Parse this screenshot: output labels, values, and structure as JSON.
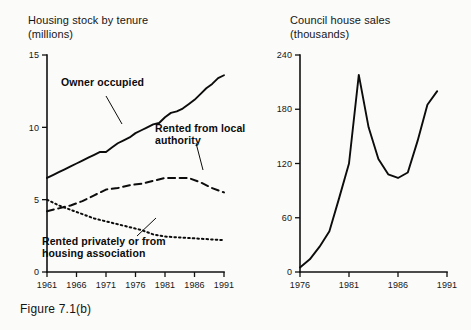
{
  "figure": {
    "caption": "Figure 7.1(b)"
  },
  "panels": {
    "left": {
      "title_line1": "Housing stock by tenure",
      "title_line2": "(millions)",
      "annotations": [
        {
          "name": "owner-occupied",
          "line1": "Owner occupied",
          "line2": ""
        },
        {
          "name": "rented-local-authority",
          "line1": "Rented from local",
          "line2": "authority"
        },
        {
          "name": "rented-privately",
          "line1": "Rented privately or from",
          "line2": "housing association"
        }
      ]
    },
    "right": {
      "title_line1": "Council house sales",
      "title_line2": "(thousands)"
    }
  },
  "chart_data": [
    {
      "id": "housing-stock-by-tenure",
      "type": "line",
      "title": "Housing stock by tenure (millions)",
      "xlabel": "",
      "ylabel": "millions",
      "xlim": [
        1961,
        1991
      ],
      "ylim": [
        0,
        15
      ],
      "yticks": [
        0,
        5,
        10,
        15
      ],
      "ytick_labels": [
        "0",
        "5",
        "10",
        "15"
      ],
      "xticks": [
        1961,
        1966,
        1971,
        1976,
        1981,
        1986,
        1991
      ],
      "xtick_labels": [
        "1961",
        "1966",
        "1971",
        "1976",
        "1981",
        "1986",
        "1991"
      ],
      "grid": false,
      "legend": "inline-annotations",
      "series": [
        {
          "name": "Owner occupied",
          "style": "solid",
          "x": [
            1961,
            1962,
            1963,
            1964,
            1965,
            1966,
            1967,
            1968,
            1969,
            1970,
            1971,
            1972,
            1973,
            1974,
            1975,
            1976,
            1977,
            1978,
            1979,
            1980,
            1981,
            1982,
            1983,
            1984,
            1985,
            1986,
            1987,
            1988,
            1989,
            1990,
            1991
          ],
          "values": [
            6.5,
            6.7,
            6.9,
            7.1,
            7.3,
            7.5,
            7.7,
            7.9,
            8.1,
            8.3,
            8.3,
            8.6,
            8.9,
            9.1,
            9.3,
            9.6,
            9.8,
            10.0,
            10.2,
            10.3,
            10.7,
            11.0,
            11.1,
            11.3,
            11.6,
            11.9,
            12.3,
            12.7,
            13.0,
            13.4,
            13.6,
            14.0,
            14.2,
            14.7,
            15.0
          ],
          "values_note": "traced from plotted curve, millions of dwellings"
        },
        {
          "name": "Rented from local authority",
          "style": "dashed",
          "x": [
            1961,
            1963,
            1965,
            1967,
            1969,
            1971,
            1973,
            1975,
            1977,
            1979,
            1981,
            1983,
            1985,
            1987,
            1989,
            1991
          ],
          "values": [
            4.2,
            4.4,
            4.6,
            4.9,
            5.3,
            5.7,
            5.8,
            6.0,
            6.1,
            6.3,
            6.5,
            6.5,
            6.5,
            6.2,
            5.8,
            5.5
          ],
          "values_note": "traced from plotted curve, millions of dwellings"
        },
        {
          "name": "Rented privately or from housing association",
          "style": "dotted",
          "x": [
            1961,
            1963,
            1965,
            1967,
            1969,
            1971,
            1973,
            1975,
            1977,
            1979,
            1981,
            1983,
            1985,
            1987,
            1989,
            1991
          ],
          "values": [
            5.0,
            4.6,
            4.3,
            4.0,
            3.7,
            3.5,
            3.3,
            3.1,
            2.9,
            2.6,
            2.45,
            2.4,
            2.35,
            2.3,
            2.25,
            2.2
          ],
          "values_note": "traced from plotted curve, millions of dwellings"
        }
      ]
    },
    {
      "id": "council-house-sales",
      "type": "line",
      "title": "Council house sales (thousands)",
      "xlabel": "",
      "ylabel": "thousands",
      "xlim": [
        1976,
        1991
      ],
      "ylim": [
        0,
        240
      ],
      "yticks": [
        0,
        60,
        120,
        180,
        240
      ],
      "ytick_labels": [
        "0",
        "60",
        "120",
        "180",
        "240"
      ],
      "xticks": [
        1976,
        1981,
        1986,
        1991
      ],
      "xtick_labels": [
        "1976",
        "1981",
        "1986",
        "1991"
      ],
      "grid": false,
      "legend": "none",
      "series": [
        {
          "name": "Council house sales",
          "style": "solid",
          "x": [
            1976,
            1977,
            1978,
            1979,
            1980,
            1981,
            1982,
            1983,
            1984,
            1985,
            1986,
            1987,
            1988,
            1989,
            1990
          ],
          "values": [
            5,
            14,
            28,
            45,
            82,
            120,
            218,
            160,
            125,
            108,
            104,
            110,
            145,
            185,
            200
          ],
          "values_note": "traced from plotted curve, thousands of sales"
        }
      ]
    }
  ]
}
